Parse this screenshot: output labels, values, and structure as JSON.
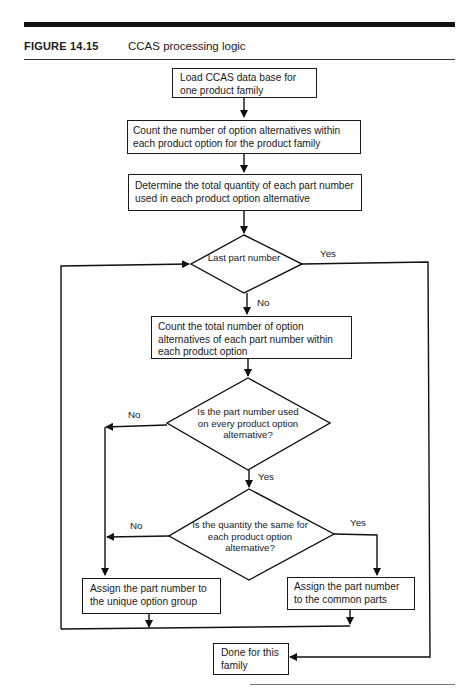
{
  "figure": {
    "label": "FIGURE 14.15",
    "title": "CCAS processing logic"
  },
  "flowchart": {
    "steps": {
      "load": "Load CCAS data base for one product family",
      "count_options": "Count the number of option alternatives within each product option for the product family",
      "determine_qty": "Determine the total quantity of each part number used in each product option alternative",
      "count_total": "Count the total number of option alternatives of each part number within each product option",
      "assign_unique": "Assign the part number to the unique option group",
      "assign_common": "Assign the part number to the common parts",
      "done": "Done for this family"
    },
    "decisions": {
      "last_part": "Last part number",
      "used_every": "Is the part number used on every product option alternative?",
      "same_qty": "Is the quantity the same for each product option alternative?"
    },
    "labels": {
      "last_yes": "Yes",
      "last_no": "No",
      "used_no": "No",
      "used_yes": "Yes",
      "qty_no": "No",
      "qty_yes": "Yes"
    }
  }
}
